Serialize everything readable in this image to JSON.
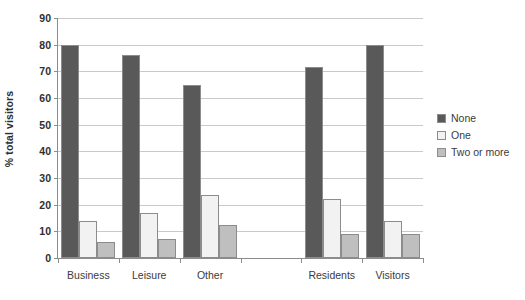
{
  "chart_data": {
    "type": "bar",
    "title": "",
    "subtitle": "",
    "xlabel": "",
    "ylabel": "% total visitors",
    "ylim": [
      0,
      90
    ],
    "ytick_step": 10,
    "yticks": [
      0,
      10,
      20,
      30,
      40,
      50,
      60,
      70,
      80,
      90
    ],
    "ytick_labels": [
      "0",
      "10",
      "20",
      "30",
      "40",
      "50",
      "60",
      "70",
      "80",
      "90"
    ],
    "grid": "horizontal",
    "legend_position": "right-middle",
    "categories": [
      "Business",
      "Leisure",
      "Other",
      "",
      "Residents",
      "Visitors"
    ],
    "series": [
      {
        "name": "None",
        "color": "#595959",
        "values": [
          80,
          76,
          65,
          null,
          71.5,
          80
        ]
      },
      {
        "name": "One",
        "color": "#F2F2F2",
        "values": [
          14,
          17,
          23.5,
          null,
          22,
          14
        ]
      },
      {
        "name": "Two or more",
        "color": "#BFBFBF",
        "values": [
          6,
          7,
          12.5,
          null,
          9,
          9
        ]
      }
    ],
    "annotations": []
  },
  "legend": {
    "items": [
      {
        "label": "None",
        "color": "#595959"
      },
      {
        "label": "One",
        "color": "#F2F2F2"
      },
      {
        "label": "Two or more",
        "color": "#BFBFBF"
      }
    ]
  },
  "axis": {
    "y_title": "% total visitors"
  },
  "style": {
    "bar_border": "#8c8c8c",
    "axis_line": "#8c8c8c",
    "gridline": "#c9c9c9",
    "text": "#3b3b3b"
  }
}
